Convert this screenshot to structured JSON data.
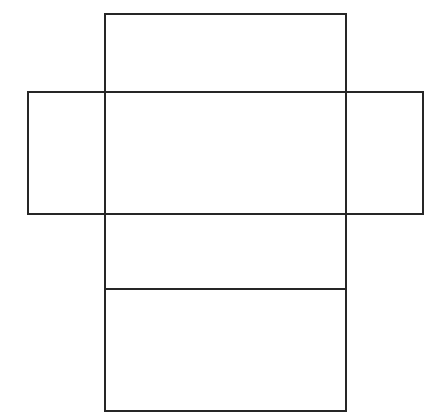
{
  "figure": {
    "name": "rectangular-box-net",
    "background_color": "#ffffff",
    "line_color": "#262626",
    "line_width": 1.6,
    "canvas": {
      "width": 440,
      "height": 417
    }
  },
  "geometry": {
    "vertical_strip": {
      "label": "vertical-strip",
      "x": 105,
      "y": 14,
      "width": 241,
      "height": 397,
      "left": 105,
      "top": 14,
      "right": 346,
      "bottom": 411
    },
    "horizontal_strip": {
      "label": "horizontal-strip",
      "x": 28,
      "y": 92,
      "width": 395,
      "height": 122,
      "left": 28,
      "top": 92,
      "right": 423,
      "bottom": 214
    },
    "fold_line": {
      "label": "lower-fold-line",
      "x1": 105,
      "y1": 289,
      "x2": 346,
      "y2": 289
    }
  },
  "faces": [
    {
      "name": "top-flap",
      "x": 105,
      "y": 14,
      "width": 241,
      "height": 78
    },
    {
      "name": "center-face",
      "x": 105,
      "y": 92,
      "width": 241,
      "height": 122
    },
    {
      "name": "left-flap",
      "x": 28,
      "y": 92,
      "width": 77,
      "height": 122
    },
    {
      "name": "right-flap",
      "x": 346,
      "y": 92,
      "width": 77,
      "height": 122
    },
    {
      "name": "middle-lower-face",
      "x": 105,
      "y": 214,
      "width": 241,
      "height": 75
    },
    {
      "name": "bottom-face",
      "x": 105,
      "y": 289,
      "width": 241,
      "height": 122
    }
  ],
  "labels": {
    "visible_text": []
  }
}
